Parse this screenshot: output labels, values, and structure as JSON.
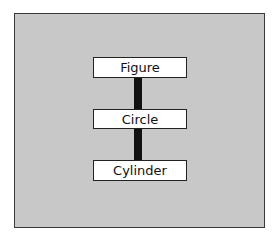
{
  "diagram": {
    "type": "hierarchy",
    "nodes": [
      {
        "label": "Figure"
      },
      {
        "label": "Circle"
      },
      {
        "label": "Cylinder"
      }
    ],
    "edges": [
      {
        "from": "Figure",
        "to": "Circle"
      },
      {
        "from": "Circle",
        "to": "Cylinder"
      }
    ],
    "colors": {
      "background": "#c8c8c8",
      "node_fill": "#ffffff",
      "connector": "#111111"
    }
  }
}
